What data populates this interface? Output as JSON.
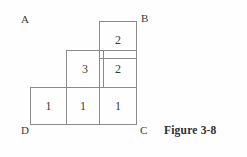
{
  "figure": {
    "caption": "Figure 3-8",
    "line_color": "#8a8a8a",
    "text_color": "#3a3a3a",
    "background": "#fefefe"
  },
  "vertices": [
    {
      "key": "A",
      "label": "A",
      "x": 21,
      "y": 14
    },
    {
      "key": "B",
      "label": "B",
      "x": 141,
      "y": 13
    },
    {
      "key": "C",
      "label": "C",
      "x": 140,
      "y": 125
    },
    {
      "key": "D",
      "label": "D",
      "x": 21,
      "y": 125
    }
  ],
  "grid": {
    "cell_size": 37,
    "origin_x": 30,
    "origin_y": 21,
    "columns": 3,
    "rows": 3,
    "cells": [
      {
        "name": "cell-r0-c2",
        "row": 0,
        "col": 2,
        "value": "2",
        "x": 99,
        "y": 21
      },
      {
        "name": "cell-r1-c1",
        "row": 1,
        "col": 1,
        "value": "3",
        "x": 66,
        "y": 50
      },
      {
        "name": "cell-r1-c2",
        "row": 1,
        "col": 2,
        "value": "2",
        "x": 99,
        "y": 50
      },
      {
        "name": "cell-r2-c0",
        "row": 2,
        "col": 0,
        "value": "1",
        "x": 30,
        "y": 87
      },
      {
        "name": "cell-r2-c1",
        "row": 2,
        "col": 1,
        "value": "1",
        "x": 66,
        "y": 87
      },
      {
        "name": "cell-r2-c2",
        "row": 2,
        "col": 2,
        "value": "1",
        "x": 99,
        "y": 87
      }
    ]
  }
}
